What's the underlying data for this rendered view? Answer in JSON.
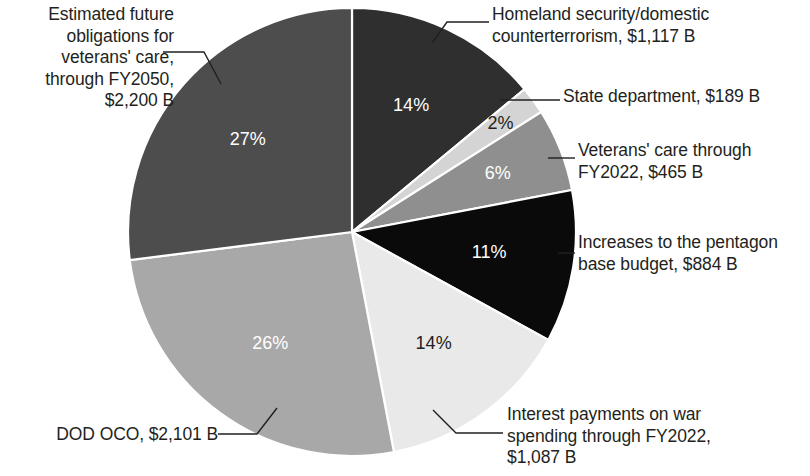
{
  "chart_data": {
    "type": "pie",
    "title": "",
    "subtitle": "",
    "xlabel": "",
    "ylabel": "",
    "legend_position": "callout-labels",
    "grid": false,
    "units": "billions of USD",
    "categories": [
      "Homeland security/domestic counterterrorism",
      "State department",
      "Veterans' care through FY2022",
      "Increases to the pentagon base budget",
      "Interest payments on war spending through FY2022",
      "DOD OCO",
      "Estimated future obligations for veterans' care, through FY2050"
    ],
    "values": [
      1117,
      189,
      465,
      884,
      1087,
      2101,
      2200
    ],
    "percents": [
      14,
      2,
      6,
      11,
      14,
      26,
      27
    ],
    "colors": [
      "#2f2f2f",
      "#d4d4d4",
      "#8f8f8f",
      "#0a0a0a",
      "#e9e9e9",
      "#a8a8a8",
      "#4d4d4d"
    ],
    "slices": [
      {
        "name": "homeland-security",
        "label": "Homeland security/domestic\ncounterterrorism, $1,117 B",
        "percent_label": "14%",
        "percent": 14,
        "value": 1117,
        "value_label": "$1,117 B",
        "color": "#2f2f2f",
        "percent_text_color": "#ffffff"
      },
      {
        "name": "state-department",
        "label": "State department, $189 B",
        "percent_label": "2%",
        "percent": 2,
        "value": 189,
        "value_label": "$189 B",
        "color": "#d4d4d4",
        "percent_text_color": "#231f20"
      },
      {
        "name": "veterans-care-fy2022",
        "label": "Veterans' care through\nFY2022, $465 B",
        "percent_label": "6%",
        "percent": 6,
        "value": 465,
        "value_label": "$465 B",
        "color": "#8f8f8f",
        "percent_text_color": "#ffffff"
      },
      {
        "name": "pentagon-base-budget",
        "label": "Increases to the pentagon\nbase budget, $884 B",
        "percent_label": "11%",
        "percent": 11,
        "value": 884,
        "value_label": "$884 B",
        "color": "#0a0a0a",
        "percent_text_color": "#ffffff"
      },
      {
        "name": "interest-payments",
        "label": "Interest payments on war\nspending through FY2022,\n$1,087 B",
        "percent_label": "14%",
        "percent": 14,
        "value": 1087,
        "value_label": "$1,087 B",
        "color": "#e9e9e9",
        "percent_text_color": "#231f20"
      },
      {
        "name": "dod-oco",
        "label": "DOD OCO, $2,101 B",
        "percent_label": "26%",
        "percent": 26,
        "value": 2101,
        "value_label": "$2,101 B",
        "color": "#a8a8a8",
        "percent_text_color": "#ffffff"
      },
      {
        "name": "future-veterans-obligations",
        "label": "Estimated future\nobligations for\nveterans' care,\nthrough FY2050,\n$2,200 B",
        "percent_label": "27%",
        "percent": 27,
        "value": 2200,
        "value_label": "$2,200 B",
        "color": "#4d4d4d",
        "percent_text_color": "#ffffff"
      }
    ]
  }
}
